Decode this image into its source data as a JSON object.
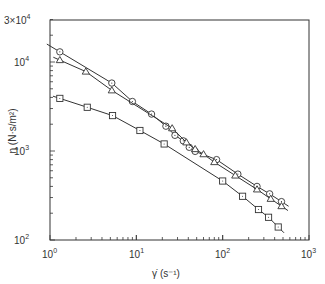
{
  "chart_data": {
    "type": "line",
    "title": "",
    "xlabel": "γ̇ (s⁻¹)",
    "ylabel": "η (N·s/m²)",
    "xscale": "log",
    "yscale": "log",
    "xlim": [
      1,
      1000
    ],
    "ylim": [
      100,
      30000
    ],
    "grid": false,
    "legend": null,
    "x_ticks": [
      "10^0",
      "10^1",
      "10^2",
      "10^3"
    ],
    "y_ticks": [
      "10^2",
      "10^3",
      "10^4",
      "3x10^4"
    ],
    "series": [
      {
        "name": "circles",
        "marker": "circle",
        "x": [
          1.3,
          5.2,
          9.0,
          15,
          22,
          28,
          35,
          41,
          48,
          85,
          150,
          250,
          350,
          480
        ],
        "y": [
          13000,
          5800,
          3600,
          2600,
          1900,
          1500,
          1300,
          1100,
          990,
          800,
          550,
          400,
          330,
          270
        ]
      },
      {
        "name": "triangles",
        "marker": "triangle",
        "x": [
          1.3,
          2.6,
          5.2,
          26,
          38,
          48,
          60,
          80,
          140,
          250,
          360,
          480
        ],
        "y": [
          10500,
          7800,
          4800,
          1800,
          1250,
          1050,
          920,
          750,
          530,
          370,
          290,
          240
        ]
      },
      {
        "name": "squares",
        "marker": "square",
        "x": [
          1.3,
          2.7,
          5.3,
          11,
          21,
          100,
          170,
          260,
          340,
          440
        ],
        "y": [
          3900,
          3100,
          2500,
          1700,
          1200,
          460,
          310,
          220,
          180,
          140
        ]
      }
    ]
  },
  "labels": {
    "x_axis": "γ̇  (s⁻¹)",
    "y_axis": "η  (N·s/m²)",
    "x_tick_0": "10",
    "x_tick_0_exp": "0",
    "x_tick_1": "10",
    "x_tick_1_exp": "1",
    "x_tick_2": "10",
    "x_tick_2_exp": "2",
    "x_tick_3": "10",
    "x_tick_3_exp": "3",
    "y_tick_2": "10",
    "y_tick_2_exp": "2",
    "y_tick_3": "10",
    "y_tick_3_exp": "3",
    "y_tick_4": "10",
    "y_tick_4_exp": "4",
    "y_tick_top": "3×10",
    "y_tick_top_exp": "4"
  }
}
